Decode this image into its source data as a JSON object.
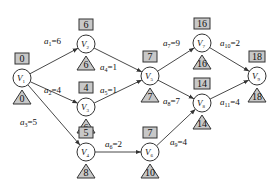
{
  "diagram": {
    "type": "AOE network (critical path)",
    "nodes": [
      {
        "id": "V1",
        "name": "V",
        "sub": "1",
        "x": 22,
        "y": 78,
        "early": "0",
        "late": "0"
      },
      {
        "id": "V2",
        "name": "V",
        "sub": "2",
        "x": 86,
        "y": 44,
        "early": "6",
        "late": "6"
      },
      {
        "id": "V3",
        "name": "V",
        "sub": "3",
        "x": 86,
        "y": 107,
        "early": "4",
        "late": "6"
      },
      {
        "id": "V4",
        "name": "V",
        "sub": "4",
        "x": 86,
        "y": 152,
        "early": "5",
        "late": "8"
      },
      {
        "id": "V5",
        "name": "V",
        "sub": "5",
        "x": 150,
        "y": 76,
        "early": "7",
        "late": "7"
      },
      {
        "id": "V6",
        "name": "V",
        "sub": "6",
        "x": 150,
        "y": 152,
        "early": "7",
        "late": "10"
      },
      {
        "id": "V7",
        "name": "V",
        "sub": "7",
        "x": 202,
        "y": 43,
        "early": "16",
        "late": "16"
      },
      {
        "id": "V8",
        "name": "V",
        "sub": "8",
        "x": 202,
        "y": 103,
        "early": "14",
        "late": "14"
      },
      {
        "id": "V9",
        "name": "V",
        "sub": "9",
        "x": 257,
        "y": 76,
        "early": "18",
        "late": "18"
      }
    ],
    "edges": [
      {
        "id": "a1",
        "from": "V1",
        "to": "V2",
        "label": "a",
        "sub": "1",
        "weight": "6",
        "lx": 44,
        "ly": 44
      },
      {
        "id": "a2",
        "from": "V1",
        "to": "V3",
        "label": "a",
        "sub": "2",
        "weight": "4",
        "lx": 44,
        "ly": 93
      },
      {
        "id": "a3",
        "from": "V1",
        "to": "V4",
        "label": "a",
        "sub": "3",
        "weight": "5",
        "lx": 20,
        "ly": 125
      },
      {
        "id": "a4",
        "from": "V2",
        "to": "V5",
        "label": "a",
        "sub": "4",
        "weight": "1",
        "lx": 100,
        "ly": 70
      },
      {
        "id": "a5",
        "from": "V3",
        "to": "V5",
        "label": "a",
        "sub": "5",
        "weight": "1",
        "lx": 100,
        "ly": 93
      },
      {
        "id": "a6",
        "from": "V4",
        "to": "V6",
        "label": "a",
        "sub": "6",
        "weight": "2",
        "lx": 105,
        "ly": 147
      },
      {
        "id": "a7",
        "from": "V5",
        "to": "V7",
        "label": "a",
        "sub": "7",
        "weight": "9",
        "lx": 163,
        "ly": 46
      },
      {
        "id": "a8",
        "from": "V5",
        "to": "V8",
        "label": "a",
        "sub": "8",
        "weight": "7",
        "lx": 163,
        "ly": 104
      },
      {
        "id": "a9",
        "from": "V6",
        "to": "V8",
        "label": "a",
        "sub": "9",
        "weight": "4",
        "lx": 170,
        "ly": 145
      },
      {
        "id": "a10",
        "from": "V7",
        "to": "V9",
        "label": "a",
        "sub": "10",
        "weight": "2",
        "lx": 220,
        "ly": 46
      },
      {
        "id": "a11",
        "from": "V8",
        "to": "V9",
        "label": "a",
        "sub": "11",
        "weight": "4",
        "lx": 220,
        "ly": 105
      }
    ]
  }
}
